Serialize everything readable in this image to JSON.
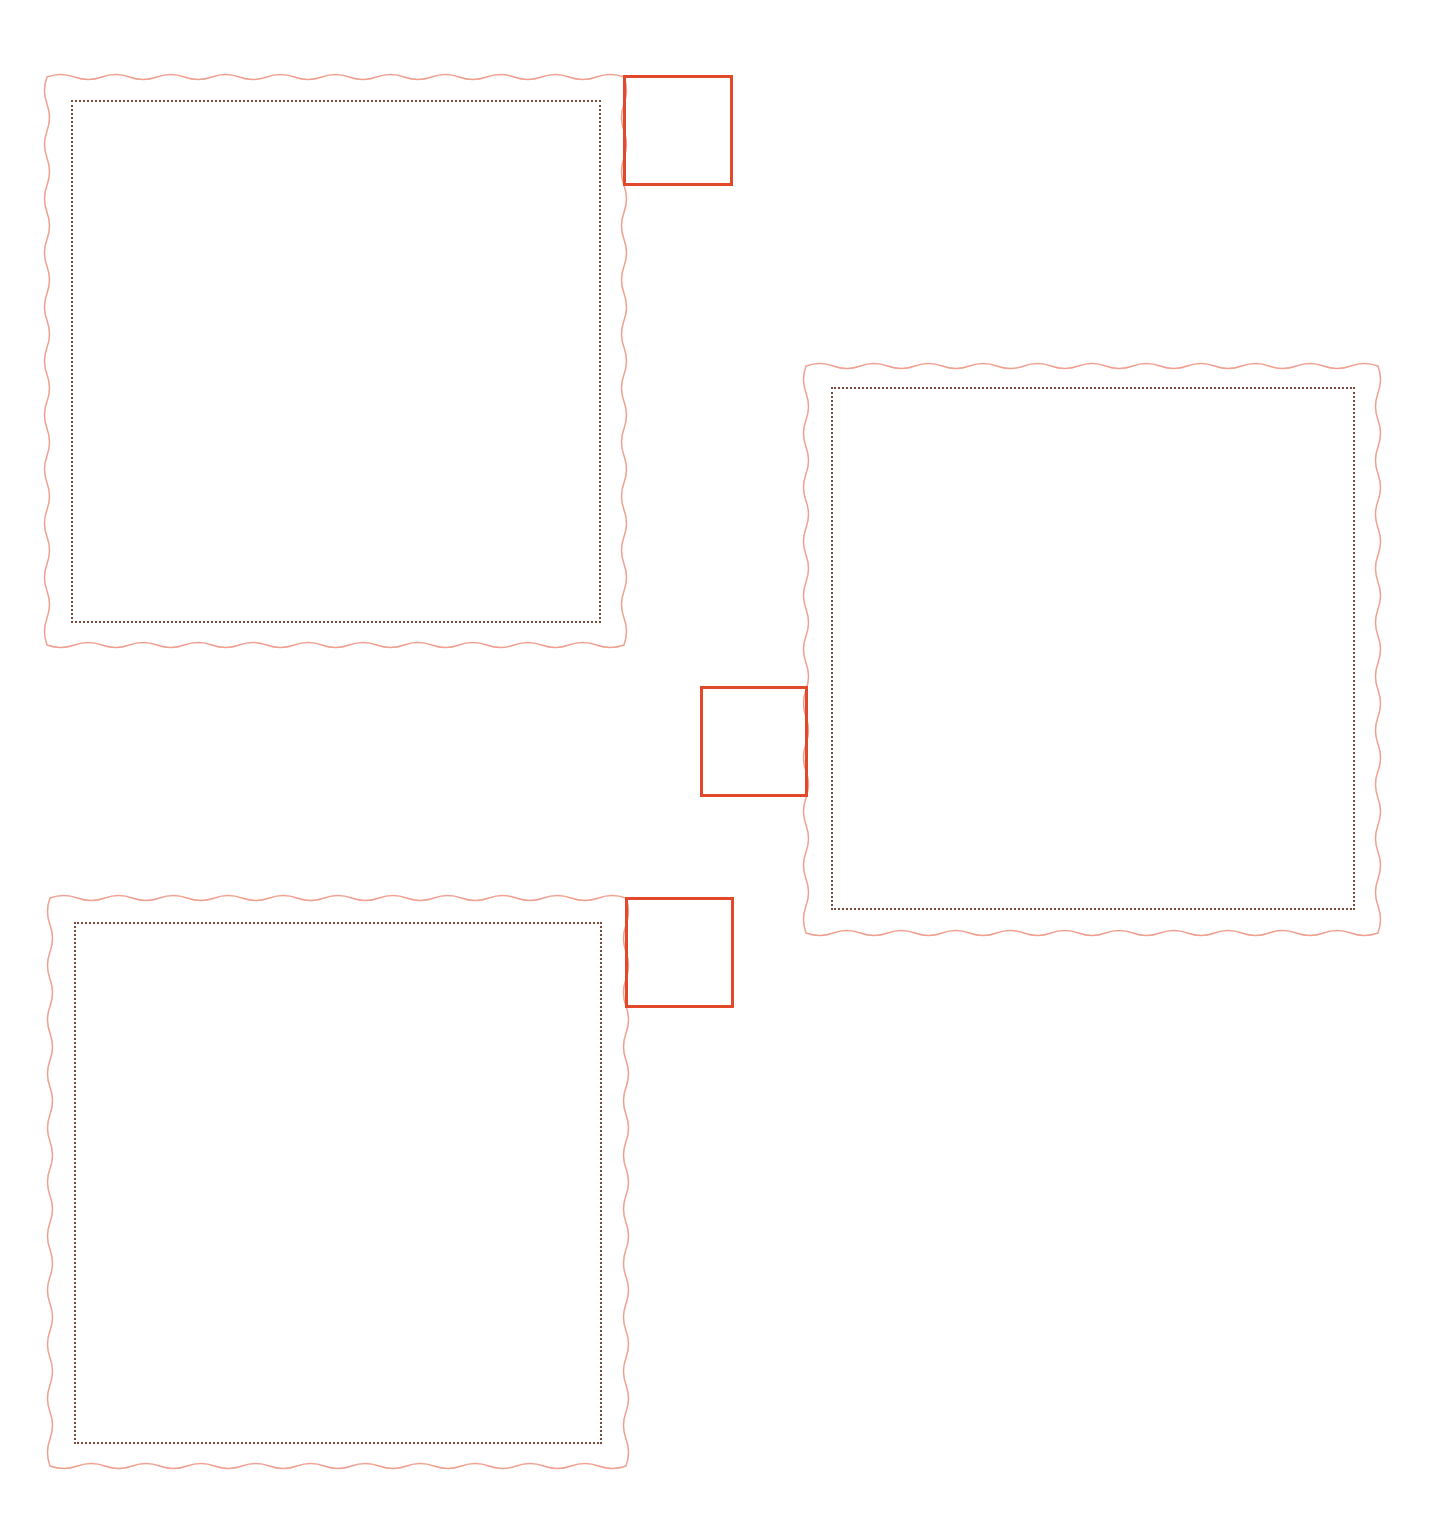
{
  "colors": {
    "wavy_border": "#f0a090",
    "dotted_border": "#7a4a3a",
    "tab_border": "#e2492a",
    "background": "#ffffff"
  },
  "frames": [
    {
      "id": "top-left",
      "outer": {
        "x": 47,
        "y": 77,
        "w": 577,
        "h": 568
      },
      "inner": {
        "x": 71,
        "y": 100,
        "w": 530,
        "h": 523
      },
      "tab": {
        "x": 623,
        "y": 75,
        "w": 110,
        "h": 111,
        "side": "right-top"
      }
    },
    {
      "id": "right",
      "outer": {
        "x": 806,
        "y": 366,
        "w": 572,
        "h": 567
      },
      "inner": {
        "x": 831,
        "y": 387,
        "w": 524,
        "h": 523
      },
      "tab": {
        "x": 700,
        "y": 686,
        "w": 108,
        "h": 111,
        "side": "left-middle"
      }
    },
    {
      "id": "bottom-left",
      "outer": {
        "x": 50,
        "y": 898,
        "w": 576,
        "h": 568
      },
      "inner": {
        "x": 74,
        "y": 922,
        "w": 528,
        "h": 522
      },
      "tab": {
        "x": 625,
        "y": 897,
        "w": 109,
        "h": 111,
        "side": "right-top"
      }
    }
  ]
}
